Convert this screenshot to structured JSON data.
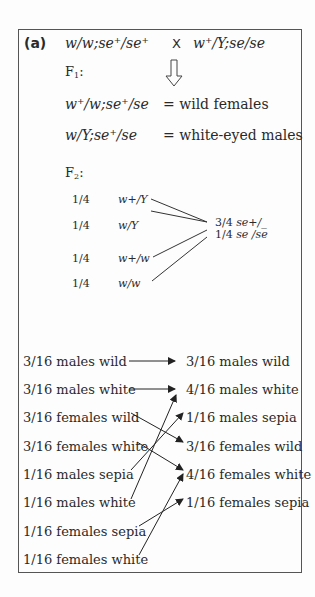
{
  "panel": {
    "label": "(a)",
    "cross": {
      "female_parent": "w/w;se⁺/se⁺",
      "symbol": "X",
      "male_parent": "w⁺/Y;se/se"
    },
    "f1": {
      "heading": "F",
      "heading_sub": "1",
      "heading_suffix": ":",
      "rows": [
        {
          "genotype": "w⁺/w;se⁺/se",
          "phenotype": "= wild females"
        },
        {
          "genotype": "w/Y;se⁺/se",
          "phenotype": "= white-eyed males"
        }
      ]
    },
    "f2": {
      "heading": "F",
      "heading_sub": "2",
      "heading_suffix": ":",
      "x_genotypes": [
        {
          "fraction": "1/4",
          "genotype": "w+/Y"
        },
        {
          "fraction": "1/4",
          "genotype": "w/Y"
        },
        {
          "fraction": "1/4",
          "genotype": "w+/w"
        },
        {
          "fraction": "1/4",
          "genotype": "w/w"
        }
      ],
      "autosomal": [
        {
          "fraction": "3/4",
          "genotype": "se+/_"
        },
        {
          "fraction": "1/4",
          "genotype": "se /se"
        }
      ]
    },
    "phenotypes_left": [
      "3/16 males wild",
      "3/16 males white",
      "3/16 females wild",
      "3/16 females white",
      "1/16 males sepia",
      "1/16 males white",
      "1/16 females sepia",
      "1/16 females white"
    ],
    "phenotypes_right": [
      "3/16 males wild",
      "4/16 males white",
      "1/16 males sepia",
      "3/16 females wild",
      "4/16 females white",
      "1/16 females sepia"
    ],
    "mappings": [
      {
        "from": "3/16 males wild",
        "to": "3/16 males wild"
      },
      {
        "from": "3/16 males white",
        "to": "4/16 males white"
      },
      {
        "from": "3/16 females wild",
        "to": "3/16 females wild"
      },
      {
        "from": "3/16 females white",
        "to": "4/16 females white"
      },
      {
        "from": "1/16 males sepia",
        "to": "1/16 males sepia"
      },
      {
        "from": "1/16 males white",
        "to": "4/16 males white"
      },
      {
        "from": "1/16 females sepia",
        "to": "1/16 females sepia"
      },
      {
        "from": "1/16 females white",
        "to": "4/16 females white"
      }
    ]
  }
}
